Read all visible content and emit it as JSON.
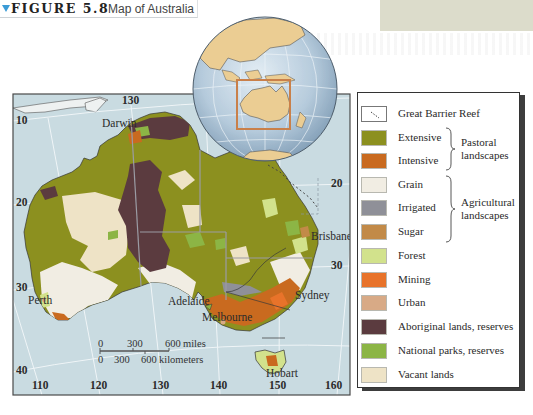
{
  "figure": {
    "number_label": "FIGURE 5.8",
    "caption": "Map of Australia",
    "accent_color": "#3b9bd6"
  },
  "map": {
    "sea_color": "#c9dbe1",
    "latitude_labels": {
      "lat10": "10",
      "lat20_left": "20",
      "lat30_left": "30",
      "lat40": "40",
      "lat20_right": "20",
      "lat30_right": "30"
    },
    "longitude_labels": {
      "top130": "130",
      "lon110": "110",
      "lon120": "120",
      "lon130": "130",
      "lon140": "140",
      "lon150": "150",
      "lon160": "160"
    },
    "cities": {
      "darwin": "Darwin",
      "brisbane": "Brisbane",
      "sydney": "Sydney",
      "melbourne": "Melbourne",
      "adelaide": "Adelaide",
      "perth": "Perth",
      "hobart": "Hobart"
    },
    "scale_bar": {
      "miles": {
        "zero": "0",
        "mid": "300",
        "end": "600",
        "unit": "miles"
      },
      "kilometers": {
        "zero": "0",
        "mid": "300",
        "end": "600",
        "unit": "kilometers"
      }
    }
  },
  "inset_globe": {
    "ocean_color": "#b7cde0",
    "land_color": "#ebcd93",
    "highlight_box_color": "#c9804a"
  },
  "legend": {
    "items": [
      {
        "label": "Great Barrier Reef",
        "color": "#ffffff",
        "icon": "dashed-reef-icon"
      },
      {
        "label": "Extensive",
        "color": "#8c901f"
      },
      {
        "label": "Intensive",
        "color": "#c96a1f"
      },
      {
        "label": "Grain",
        "color": "#f1ede3"
      },
      {
        "label": "Irrigated",
        "color": "#8f9098"
      },
      {
        "label": "Sugar",
        "color": "#c28a48"
      },
      {
        "label": "Forest",
        "color": "#d2e28c"
      },
      {
        "label": "Mining",
        "color": "#e8732a"
      },
      {
        "label": "Urban",
        "color": "#d8aa86"
      },
      {
        "label": "Aboriginal lands, reserves",
        "color": "#5b3b3f"
      },
      {
        "label": "National parks, reserves",
        "color": "#8cb545"
      },
      {
        "label": "Vacant lands",
        "color": "#eee3c6"
      }
    ],
    "groups": {
      "pastoral": {
        "line1": "Pastoral",
        "line2": "landscapes"
      },
      "agricultural": {
        "line1": "Agricultural",
        "line2": "landscapes"
      }
    }
  }
}
